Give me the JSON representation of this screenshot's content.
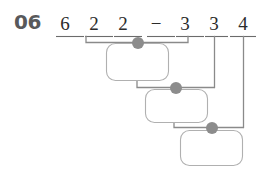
{
  "worksheet": {
    "item_number": "06",
    "problem_type": "expression-tree-worksheet",
    "expression_text": "6 2 2 − 3 3 4",
    "colors": {
      "item_number": "#58595b",
      "digit": "#2b2b2b",
      "rule_line": "#6b6b6b",
      "bracket_line": "#8a8a8a",
      "box_outline": "#a9a9a9",
      "node_dot": "#8c8c8c",
      "background": "#ffffff"
    }
  },
  "expression": {
    "terms": [
      {
        "id": "term-1",
        "label": "6",
        "kind": "digit",
        "x": 65,
        "rule_x1": 56,
        "rule_x2": 84
      },
      {
        "id": "term-2",
        "label": "2",
        "kind": "digit",
        "x": 94,
        "rule_x1": 85,
        "rule_x2": 113
      },
      {
        "id": "term-3",
        "label": "2",
        "kind": "digit",
        "x": 123,
        "rule_x1": 114,
        "rule_x2": 142
      },
      {
        "id": "term-4",
        "label": "−",
        "kind": "operator",
        "x": 156,
        "rule_x1": 147,
        "rule_x2": 175
      },
      {
        "id": "term-5",
        "label": "3",
        "kind": "digit",
        "x": 185,
        "rule_x1": 176,
        "rule_x2": 204
      },
      {
        "id": "term-6",
        "label": "3",
        "kind": "digit",
        "x": 214,
        "rule_x1": 205,
        "rule_x2": 228
      },
      {
        "id": "term-7",
        "label": "4",
        "kind": "digit",
        "x": 243,
        "rule_x1": 230,
        "rule_x2": 256
      }
    ]
  },
  "answer_boxes": [
    {
      "id": "answer-box-1",
      "value": "",
      "placeholder": "",
      "x": 106,
      "y": 43,
      "w": 63,
      "h": 38
    },
    {
      "id": "answer-box-2",
      "value": "",
      "placeholder": "",
      "x": 145,
      "y": 89,
      "w": 63,
      "h": 34
    },
    {
      "id": "answer-box-3",
      "value": "",
      "placeholder": "",
      "x": 180,
      "y": 130,
      "w": 63,
      "h": 36
    }
  ],
  "nodes": [
    {
      "id": "node-1",
      "cx": 138,
      "cy": 43,
      "r": 6
    },
    {
      "id": "node-2",
      "cx": 176,
      "cy": 88,
      "r": 6
    },
    {
      "id": "node-3",
      "cx": 212,
      "cy": 128,
      "r": 6
    }
  ]
}
